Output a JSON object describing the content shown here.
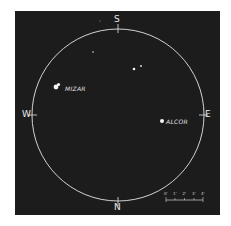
{
  "figure": {
    "background_color": "#1c1c1c",
    "circle_color": "#e6e6e6",
    "compass": {
      "top": "S",
      "bottom": "N",
      "left": "W",
      "right": "E"
    },
    "stars": [
      {
        "name": "MIZAR",
        "label": "MIZAR"
      },
      {
        "name": "ALCOR",
        "label": "ALCOR"
      }
    ],
    "scale": {
      "ticks": [
        "0'",
        "1'",
        "2'",
        "3'",
        "4'"
      ]
    }
  }
}
